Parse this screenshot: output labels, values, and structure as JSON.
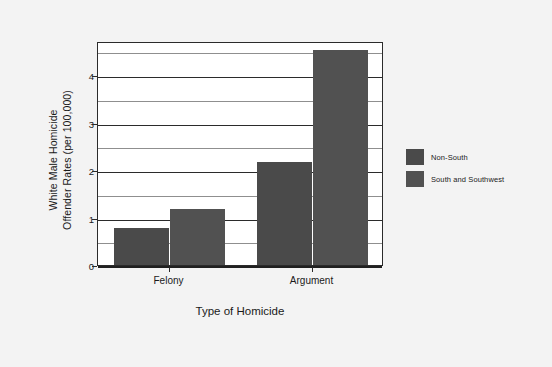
{
  "chart_data": {
    "type": "bar",
    "title": "",
    "subtitle": "",
    "xlabel": "Type of Homicide",
    "ylabel": "White Male Homicide Offender Rates (per 100,000)",
    "ylabel_lines": [
      "White Male Homicide",
      "Offender Rates (per 100,000)"
    ],
    "categories": [
      "Felony",
      "Argument"
    ],
    "series": [
      {
        "name": "Non-South",
        "values": [
          0.8,
          2.2
        ],
        "color": "#4a4a4a"
      },
      {
        "name": "South and Southwest",
        "values": [
          1.2,
          4.55
        ],
        "color": "#515151"
      }
    ],
    "ylim": [
      0,
      4.72
    ],
    "ytick_values": [
      0,
      1,
      2,
      3,
      4
    ],
    "ytick_labels": [
      "0",
      "1",
      "2",
      "3",
      "4"
    ],
    "minor_gridline_values": [
      0.5,
      1.5,
      2.5,
      3.5,
      4.5
    ],
    "grid": true,
    "legend_position": "right",
    "plot_background": "#ffffff",
    "figure_background": "#f3f3f3",
    "axis_color": "#2b2b2b"
  },
  "legend": {
    "entries": [
      {
        "label": "Non-South"
      },
      {
        "label": "South and Southwest"
      }
    ]
  }
}
